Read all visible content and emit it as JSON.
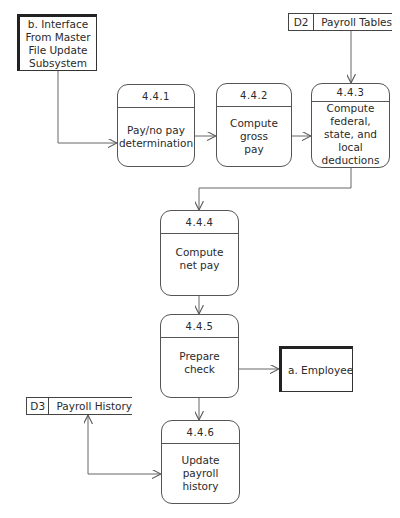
{
  "diagram": {
    "type": "data-flow-diagram",
    "external_entities": [
      {
        "id": "b",
        "label": "b. Interface From Master File Update Subsystem",
        "lines": [
          "b. Interface",
          "From Master",
          "File Update",
          "Subsystem"
        ]
      },
      {
        "id": "a",
        "label": "a. Employee"
      }
    ],
    "data_stores": [
      {
        "id": "D2",
        "name": "Payroll Tables"
      },
      {
        "id": "D3",
        "name": "Payroll History"
      }
    ],
    "processes": [
      {
        "id": "4.4.1",
        "label": "Pay/no pay determination"
      },
      {
        "id": "4.4.2",
        "label": "Compute gross pay"
      },
      {
        "id": "4.4.3",
        "label": "Compute federal, state, and local deductions"
      },
      {
        "id": "4.4.4",
        "label": "Compute net pay"
      },
      {
        "id": "4.4.5",
        "label": "Prepare check"
      },
      {
        "id": "4.4.6",
        "label": "Update payroll history"
      }
    ],
    "flows": [
      {
        "from": "b",
        "to": "4.4.1"
      },
      {
        "from": "4.4.1",
        "to": "4.4.2"
      },
      {
        "from": "4.4.2",
        "to": "4.4.3"
      },
      {
        "from": "D2",
        "to": "4.4.3"
      },
      {
        "from": "4.4.3",
        "to": "4.4.4"
      },
      {
        "from": "4.4.4",
        "to": "4.4.5"
      },
      {
        "from": "4.4.5",
        "to": "a"
      },
      {
        "from": "4.4.5",
        "to": "4.4.6"
      },
      {
        "from": "4.4.6",
        "to": "D3",
        "bidirectional": true
      }
    ]
  }
}
